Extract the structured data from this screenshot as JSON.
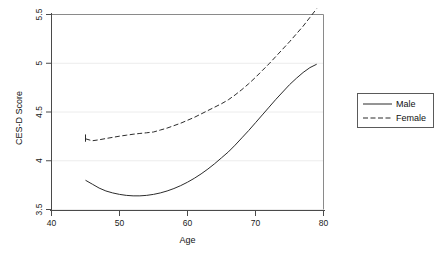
{
  "chart_data": {
    "type": "line",
    "title": "",
    "xlabel": "Age",
    "ylabel": "CES-D Score",
    "xlim": [
      40,
      80
    ],
    "ylim": [
      3.5,
      5.5
    ],
    "xticks": [
      "40",
      "50",
      "60",
      "70",
      "80"
    ],
    "xtick_values": [
      40,
      50,
      60,
      70,
      80
    ],
    "yticks": [
      "3.5",
      "4",
      "4.5",
      "5",
      "5.5"
    ],
    "ytick_values": [
      3.5,
      4,
      4.5,
      5,
      5.5
    ],
    "grid": "horizontal",
    "legend_position": "right",
    "series": [
      {
        "name": "Male",
        "style": "solid",
        "color": "#2b2b2b",
        "x": [
          45,
          46,
          47,
          48,
          49,
          50,
          51,
          52,
          53,
          54,
          55,
          56,
          57,
          58,
          59,
          60,
          61,
          62,
          63,
          64,
          65,
          66,
          67,
          68,
          69,
          70,
          71,
          72,
          73,
          74,
          75,
          76,
          77,
          78,
          79
        ],
        "values": [
          3.8,
          3.76,
          3.72,
          3.69,
          3.67,
          3.655,
          3.645,
          3.64,
          3.64,
          3.645,
          3.655,
          3.67,
          3.69,
          3.715,
          3.745,
          3.78,
          3.82,
          3.865,
          3.915,
          3.97,
          4.03,
          4.09,
          4.16,
          4.235,
          4.31,
          4.39,
          4.47,
          4.55,
          4.63,
          4.705,
          4.78,
          4.845,
          4.905,
          4.955,
          4.99
        ]
      },
      {
        "name": "Female",
        "style": "dashed",
        "color": "#2b2b2b",
        "x": [
          45,
          46,
          47,
          48,
          49,
          50,
          51,
          52,
          53,
          54,
          55,
          56,
          57,
          58,
          59,
          60,
          61,
          62,
          63,
          64,
          65,
          66,
          67,
          68,
          69,
          70,
          71,
          72,
          73,
          74,
          75,
          76,
          77,
          78,
          79
        ],
        "values": [
          4.225,
          4.205,
          4.215,
          4.228,
          4.24,
          4.252,
          4.262,
          4.272,
          4.28,
          4.287,
          4.295,
          4.315,
          4.335,
          4.36,
          4.385,
          4.415,
          4.445,
          4.48,
          4.515,
          4.55,
          4.585,
          4.625,
          4.675,
          4.73,
          4.79,
          4.855,
          4.925,
          4.995,
          5.07,
          5.145,
          5.22,
          5.3,
          5.38,
          5.47,
          5.56
        ]
      }
    ],
    "annotations": [
      {
        "name": "female-start-tick",
        "x": 45,
        "y_top": 4.27,
        "y_bottom": 4.195
      }
    ]
  },
  "legend": {
    "entries": [
      {
        "label": "Male",
        "style": "solid"
      },
      {
        "label": "Female",
        "style": "dashed"
      }
    ]
  },
  "axes": {
    "x_title": "Age",
    "y_title": "CES-D Score"
  },
  "colors": {
    "line": "#2b2b2b",
    "grid": "#e8e8e8",
    "axis": "#555555",
    "frame": "#777777",
    "text": "#111111"
  }
}
